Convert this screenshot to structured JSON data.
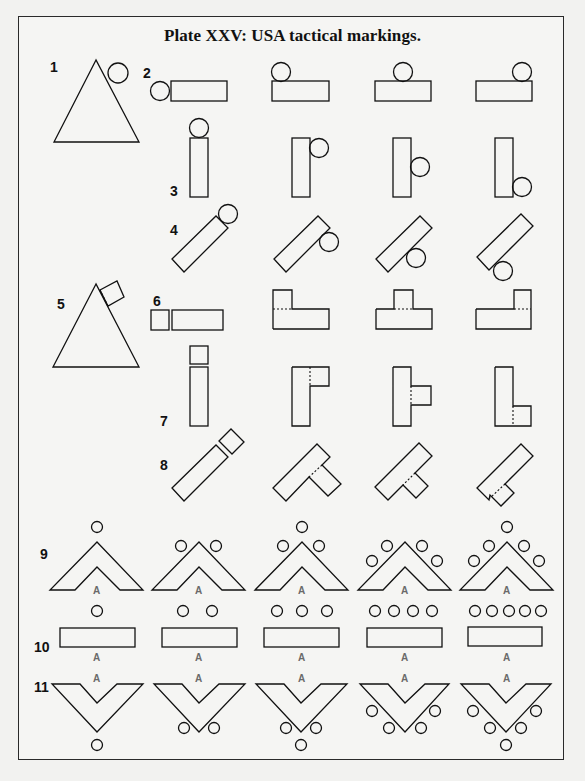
{
  "title": "Plate XXV: USA tactical markings.",
  "colors": {
    "background": "#f5f5f3",
    "line": "#111111",
    "letter_a": "#6a6a6a"
  },
  "row_numbers": [
    "1",
    "2",
    "3",
    "4",
    "5",
    "6",
    "7",
    "8",
    "9",
    "10",
    "11"
  ],
  "letter_label": "A",
  "rows": [
    {
      "number": "1",
      "shape": "triangle",
      "variants": [
        {
          "circle": "upper-right edge"
        }
      ]
    },
    {
      "number": "2",
      "shape": "horizontal-rectangle",
      "variants": [
        {
          "circle": "left"
        },
        {
          "circle": "top-left"
        },
        {
          "circle": "top-center"
        },
        {
          "circle": "top-right"
        }
      ]
    },
    {
      "number": "3",
      "shape": "vertical-rectangle",
      "variants": [
        {
          "circle": "top"
        },
        {
          "circle": "right-upper"
        },
        {
          "circle": "right-middle"
        },
        {
          "circle": "right-lower"
        }
      ]
    },
    {
      "number": "4",
      "shape": "diagonal-rectangle",
      "variants": [
        {
          "circle": "top-end"
        },
        {
          "circle": "side-upper"
        },
        {
          "circle": "side-middle"
        },
        {
          "circle": "side-lower"
        }
      ]
    },
    {
      "number": "5",
      "shape": "triangle",
      "variants": [
        {
          "square": "upper-right edge"
        }
      ]
    },
    {
      "number": "6",
      "shape": "horizontal-rectangle",
      "variants": [
        {
          "square": "left"
        },
        {
          "square": "top-left"
        },
        {
          "square": "top-center"
        },
        {
          "square": "top-right"
        }
      ]
    },
    {
      "number": "7",
      "shape": "vertical-rectangle",
      "variants": [
        {
          "square": "top"
        },
        {
          "square": "right-upper"
        },
        {
          "square": "right-middle"
        },
        {
          "square": "right-lower"
        }
      ]
    },
    {
      "number": "8",
      "shape": "diagonal-rectangle",
      "variants": [
        {
          "square": "top-end"
        },
        {
          "square": "side-upper"
        },
        {
          "square": "side-middle"
        },
        {
          "square": "side-lower"
        }
      ]
    },
    {
      "number": "9",
      "shape": "chevron-up",
      "variants": [
        {
          "circles": 1
        },
        {
          "circles": 2
        },
        {
          "circles": 3
        },
        {
          "circles": 4
        },
        {
          "circles": 5
        }
      ]
    },
    {
      "number": "10",
      "shape": "bar",
      "variants": [
        {
          "circles": 1
        },
        {
          "circles": 2
        },
        {
          "circles": 3
        },
        {
          "circles": 4
        },
        {
          "circles": 5
        }
      ]
    },
    {
      "number": "11",
      "shape": "chevron-down",
      "variants": [
        {
          "circles": 1
        },
        {
          "circles": 2
        },
        {
          "circles": 3
        },
        {
          "circles": 4
        },
        {
          "circles": 5
        }
      ]
    }
  ]
}
